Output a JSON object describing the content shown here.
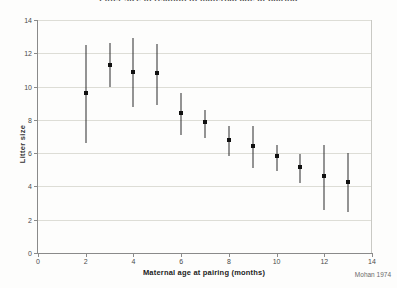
{
  "chart_data": {
    "type": "scatter",
    "title": "Litter size in relation to maternal age at pairing",
    "xlabel": "Maternal age at pairing (months)",
    "ylabel": "Litter size",
    "source": "Mohan 1974",
    "xlim": [
      0,
      14
    ],
    "ylim": [
      0,
      14
    ],
    "xticks": [
      "0",
      "2",
      "4",
      "6",
      "8",
      "10",
      "12",
      "14"
    ],
    "yticks": [
      "0",
      "2",
      "4",
      "6",
      "8",
      "10",
      "12",
      "14"
    ],
    "xtick_values": [
      0,
      2,
      4,
      6,
      8,
      10,
      12,
      14
    ],
    "ytick_values": [
      0,
      2,
      4,
      6,
      8,
      10,
      12,
      14
    ],
    "grid": "horizontal",
    "legend": "none",
    "marker_color": "#111111",
    "errorbar_color": "#2b2b2b",
    "gridline_color": "#ddddd6",
    "axis_color": "#8a8a8a",
    "series": [
      {
        "name": "Mean litter size with range",
        "x": [
          2,
          3,
          4,
          5,
          6,
          7,
          8,
          9,
          10,
          11,
          12,
          13
        ],
        "values": [
          9.6,
          11.3,
          10.9,
          10.8,
          8.4,
          7.85,
          6.8,
          6.4,
          5.85,
          5.15,
          4.65,
          4.25
        ],
        "error_low": [
          6.6,
          9.95,
          8.8,
          8.9,
          7.1,
          6.9,
          5.85,
          5.1,
          4.95,
          4.2,
          2.6,
          2.45
        ],
        "error_high": [
          12.5,
          12.6,
          12.9,
          12.55,
          9.6,
          8.6,
          7.65,
          7.65,
          6.5,
          5.95,
          6.5,
          6.0
        ]
      }
    ],
    "points": [
      {
        "x": 2,
        "y": 9.6,
        "low": 6.6,
        "high": 12.5
      },
      {
        "x": 3,
        "y": 11.3,
        "low": 9.95,
        "high": 12.6
      },
      {
        "x": 4,
        "y": 10.9,
        "low": 8.8,
        "high": 12.9
      },
      {
        "x": 5,
        "y": 10.8,
        "low": 8.9,
        "high": 12.55
      },
      {
        "x": 6,
        "y": 8.4,
        "low": 7.1,
        "high": 9.6
      },
      {
        "x": 7,
        "y": 7.85,
        "low": 6.9,
        "high": 8.6
      },
      {
        "x": 8,
        "y": 6.8,
        "low": 5.85,
        "high": 7.65
      },
      {
        "x": 9,
        "y": 6.4,
        "low": 5.1,
        "high": 7.65
      },
      {
        "x": 10,
        "y": 5.85,
        "low": 4.95,
        "high": 6.5
      },
      {
        "x": 11,
        "y": 5.15,
        "low": 4.2,
        "high": 5.95
      },
      {
        "x": 12,
        "y": 4.65,
        "low": 2.6,
        "high": 6.5
      },
      {
        "x": 13,
        "y": 4.25,
        "low": 2.45,
        "high": 6.0
      }
    ]
  }
}
